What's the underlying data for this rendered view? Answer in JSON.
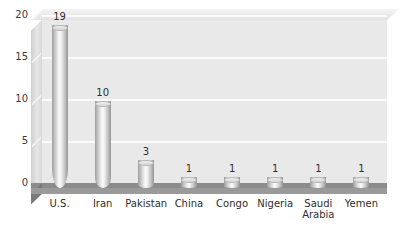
{
  "chart_data": {
    "type": "bar",
    "title": "",
    "subtitle": "",
    "xlabel": "",
    "ylabel": "",
    "categories": [
      "U.S.",
      "Iran",
      "Pakistan",
      "China",
      "Congo",
      "Nigeria",
      "Saudi Arabia",
      "Yemen"
    ],
    "values": [
      19,
      10,
      3,
      1,
      1,
      1,
      1,
      1
    ],
    "data_labels": [
      "19",
      "10",
      "3",
      "1",
      "1",
      "1",
      "1",
      "1"
    ],
    "ylim": [
      0,
      20
    ],
    "ytick_labels": [
      "0",
      "5",
      "10",
      "15",
      "20"
    ],
    "ytick_values": [
      0,
      5,
      10,
      15,
      20
    ],
    "grid": true,
    "legend": "none",
    "style": "3d-cylinder",
    "colors": {
      "plot_background": "#e9e9e9",
      "gridline": "#fbfbfb",
      "floor": "#8c8c8c",
      "bar_light": "#fbfbfb",
      "bar_dark": "#919191",
      "text": "#2e2e2e",
      "page_background": "#ffffff"
    }
  }
}
